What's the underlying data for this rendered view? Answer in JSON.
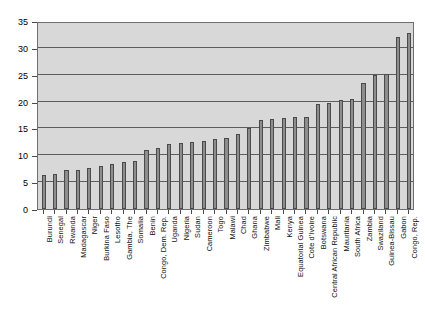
{
  "chart_data": {
    "type": "bar",
    "title": "",
    "subtitle": "",
    "xlabel": "",
    "ylabel": "",
    "ylim": [
      0,
      35
    ],
    "yticks": [
      0,
      5,
      10,
      15,
      20,
      25,
      30,
      35
    ],
    "grid": true,
    "legend": null,
    "orientation": "vertical",
    "bar_color": "#8d8d8d",
    "bar_edge_color": "#4a4a4a",
    "plot_background": "#d8d8d8",
    "gridline_color": "#5d5d5d",
    "categories": [
      "Burundi",
      "Senegal",
      "Rwanda",
      "Madagascar",
      "Niger",
      "Burkina Faso",
      "Lesotho",
      "Gambia, The",
      "Somalia",
      "Benin",
      "Congo, Dem. Rep.",
      "Uganda",
      "Nigeria",
      "Sudan",
      "Cameroon",
      "Togo",
      "Malawi",
      "Chad",
      "Ghana",
      "Zimbabwe",
      "Mali",
      "Kenya",
      "Equatorial Guinea",
      "Cote d'Ivoire",
      "Botswana",
      "Central African Republic",
      "Mauritania",
      "South Africa",
      "Zambia",
      "Swaziland",
      "Guinea-Bissau",
      "Gabon",
      "Congo, Rep."
    ],
    "values": [
      6.3,
      6.6,
      7.2,
      7.3,
      7.6,
      8.0,
      8.3,
      8.8,
      9.0,
      11.0,
      11.4,
      12.1,
      12.3,
      12.4,
      12.6,
      13.1,
      13.2,
      14.0,
      15.0,
      16.6,
      16.8,
      17.0,
      17.1,
      17.2,
      19.5,
      19.8,
      20.3,
      20.4,
      23.5,
      25.0,
      25.2,
      32.0,
      32.8
    ]
  }
}
